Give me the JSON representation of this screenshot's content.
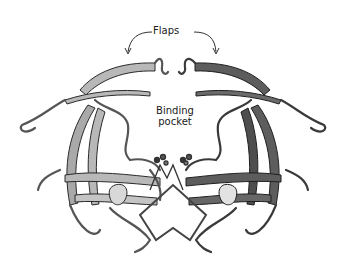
{
  "figure": {
    "labels": {
      "flaps": "Flaps",
      "binding_pocket_line1": "Binding",
      "binding_pocket_line2": "pocket"
    },
    "colors": {
      "left_monomer": "#b5b5b5",
      "right_monomer": "#5a5a5a",
      "outline": "#2a2a2a",
      "background": "#ffffff"
    }
  }
}
